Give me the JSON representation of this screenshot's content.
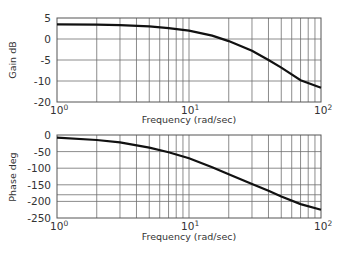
{
  "chart_data": [
    {
      "type": "line",
      "title": "",
      "xlabel": "Frequency (rad/sec)",
      "ylabel": "Gain dB",
      "xscale": "log",
      "xlim": [
        1,
        100
      ],
      "ylim": [
        -20,
        5
      ],
      "grid": true,
      "xticks": [
        "10^0",
        "10^1",
        "10^2"
      ],
      "yticks": [
        "5",
        "0",
        "-5",
        "-10",
        "-20"
      ],
      "series": [
        {
          "name": "Gain",
          "x": [
            1,
            2,
            3,
            5,
            7,
            10,
            15,
            20,
            30,
            40,
            50,
            70,
            100
          ],
          "y": [
            3.5,
            3.4,
            3.3,
            3.0,
            2.6,
            2.0,
            0.8,
            -0.5,
            -2.8,
            -5.0,
            -6.8,
            -9.8,
            -13.2
          ]
        }
      ]
    },
    {
      "type": "line",
      "title": "",
      "xlabel": "Frequency (rad/sec)",
      "ylabel": "Phase deg",
      "xscale": "log",
      "xlim": [
        1,
        100
      ],
      "ylim": [
        -250,
        0
      ],
      "grid": true,
      "xticks": [
        "10^0",
        "10^1",
        "10^2"
      ],
      "yticks": [
        "0",
        "-50",
        "-100",
        "-150",
        "-200",
        "-250"
      ],
      "reference_line": -180,
      "series": [
        {
          "name": "Phase",
          "x": [
            1,
            2,
            3,
            5,
            7,
            10,
            15,
            20,
            30,
            40,
            50,
            70,
            100
          ],
          "y": [
            -8,
            -15,
            -22,
            -38,
            -52,
            -70,
            -97,
            -118,
            -148,
            -168,
            -185,
            -208,
            -225
          ]
        }
      ]
    }
  ],
  "labels": {
    "gain_ylabel": "Gain dB",
    "phase_ylabel": "Phase deg",
    "xlabel_top": "Frequency (rad/sec)",
    "xlabel_bottom": "Frequency (rad/sec)",
    "gain_yticks": [
      "5",
      "0",
      "-5",
      "-10",
      "-20"
    ],
    "phase_yticks": [
      "0",
      "-50",
      "-100",
      "-150",
      "-200",
      "-250"
    ],
    "x_base": "10",
    "x_exps": [
      "0",
      "1",
      "2"
    ]
  }
}
